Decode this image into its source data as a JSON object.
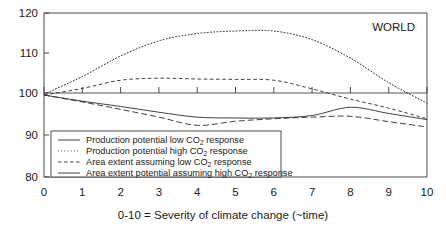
{
  "chart_data": {
    "type": "line",
    "title": "",
    "annotation": "WORLD",
    "xlabel": "0-10 = Severity of climate change (~time)",
    "ylabel": "",
    "xlim": [
      0,
      10
    ],
    "ylim": [
      80,
      120
    ],
    "grid": false,
    "reference_line_y": 100,
    "legend_position": "lower-left-inside",
    "x_ticks": [
      "0",
      "1",
      "2",
      "3",
      "4",
      "5",
      "6",
      "7",
      "8",
      "9",
      "10"
    ],
    "y_ticks": [
      "80",
      "90",
      "100",
      "110",
      "120"
    ],
    "x": [
      0,
      1,
      2,
      3,
      4,
      5,
      6,
      7,
      8,
      9,
      10
    ],
    "series": [
      {
        "name": "Production potential low CO2 response",
        "name_prefix": "Production potential low CO",
        "name_sub": "2",
        "name_suffix": " response",
        "style": "solid",
        "values": [
          100,
          98.5,
          97.2,
          95.8,
          94.6,
          94.4,
          94.4,
          95.0,
          97.0,
          95.5,
          94.0
        ]
      },
      {
        "name": "Production potential high CO2 response",
        "name_prefix": "Production potential high CO",
        "name_sub": "2",
        "name_suffix": " response",
        "style": "dotted",
        "values": [
          100.2,
          104.5,
          109.5,
          113.2,
          115.0,
          115.6,
          115.6,
          113.5,
          109.0,
          103.0,
          98.0
        ]
      },
      {
        "name": "Area extent assuming low CO2 response",
        "name_prefix": "Area extent assuming low CO",
        "name_sub": "2",
        "name_suffix": " response",
        "style": "dashed",
        "values": [
          100,
          101.6,
          103.6,
          104.1,
          103.9,
          103.8,
          103.6,
          101.5,
          99.0,
          96.8,
          94.2
        ]
      },
      {
        "name": "Area extent potential assuming high CO2 response",
        "name_prefix": "Area extent potential assuming high CO",
        "name_sub": "2",
        "name_suffix": " response",
        "style": "long-dash",
        "values": [
          100,
          98.3,
          96.5,
          94.6,
          92.6,
          93.6,
          94.2,
          94.6,
          94.8,
          93.5,
          92.2
        ]
      }
    ]
  },
  "legend": {
    "entries": [
      {
        "prefix": "Production potential low CO",
        "sub": "2",
        "suffix": " response",
        "style": "solid"
      },
      {
        "prefix": "Production potential high CO",
        "sub": "2",
        "suffix": " response",
        "style": "dotted"
      },
      {
        "prefix": "Area extent assuming low CO",
        "sub": "2",
        "suffix": " response",
        "style": "dashed"
      },
      {
        "prefix": "Area extent potential assuming high CO",
        "sub": "2",
        "suffix": " response",
        "style": "solid"
      }
    ]
  },
  "annotation": {
    "region": "WORLD"
  },
  "caption": {
    "text": "0-10 = Severity of climate change (~time)"
  }
}
